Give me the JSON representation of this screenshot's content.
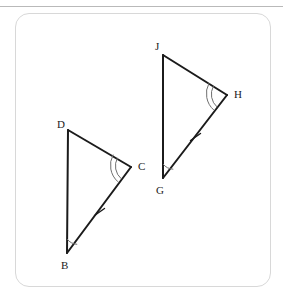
{
  "figure": {
    "stroke_color": "#1b1b1b",
    "arc_color": "#6f6f6f",
    "card_border_color": "#d8d8d8",
    "rule_color": "#b9b9b9",
    "background_color": "#ffffff",
    "triangles": [
      {
        "name": "triangle-bcd",
        "vertices": [
          {
            "label": "D",
            "x": 68,
            "y": 130,
            "label_x": 57,
            "label_y": 128
          },
          {
            "label": "B",
            "x": 67,
            "y": 253,
            "label_x": 61,
            "label_y": 269
          },
          {
            "label": "C",
            "x": 131,
            "y": 167,
            "label_x": 138,
            "label_y": 170
          }
        ],
        "angle_marks": [
          {
            "vertex": "B",
            "arcs": 1
          },
          {
            "vertex": "C",
            "arcs": 2
          }
        ],
        "side_ticks": [
          {
            "side": "BC",
            "ticks": 1
          }
        ]
      },
      {
        "name": "triangle-ghj",
        "vertices": [
          {
            "label": "J",
            "x": 163,
            "y": 55,
            "label_x": 155,
            "label_y": 50
          },
          {
            "label": "G",
            "x": 163,
            "y": 178,
            "label_x": 156,
            "label_y": 194
          },
          {
            "label": "H",
            "x": 227,
            "y": 95,
            "label_x": 234,
            "label_y": 98
          }
        ],
        "angle_marks": [
          {
            "vertex": "G",
            "arcs": 1
          },
          {
            "vertex": "H",
            "arcs": 2
          }
        ],
        "side_ticks": [
          {
            "side": "GH",
            "ticks": 1
          }
        ]
      }
    ]
  }
}
